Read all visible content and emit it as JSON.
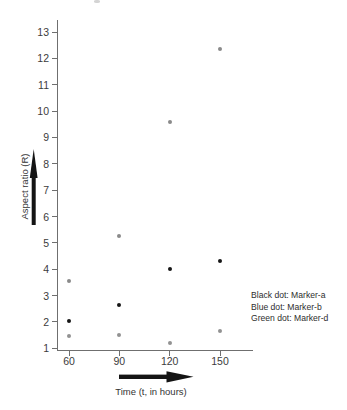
{
  "figure": {
    "background": "#ffffff",
    "axis_color": "#6f6f6f",
    "tick_text_color": "#3c3c3c",
    "arrow_color": "#141414"
  },
  "chart_data": {
    "type": "scatter",
    "title": "",
    "xlabel": "Time (t, in hours)",
    "ylabel": "Aspect ratio (R)",
    "x_ticks": [
      60,
      90,
      120,
      150
    ],
    "y_ticks": [
      1,
      2,
      3,
      4,
      5,
      6,
      7,
      8,
      9,
      10,
      11,
      12,
      13
    ],
    "xlim": [
      55,
      170
    ],
    "ylim": [
      1,
      13.5
    ],
    "grid": false,
    "legend_position": "right-middle",
    "series": [
      {
        "name": "Marker-a",
        "legend_label": "Black dot: Marker-a",
        "color": "#161616",
        "x": [
          60,
          90,
          120,
          150
        ],
        "y": [
          2.05,
          2.65,
          4.0,
          4.3
        ]
      },
      {
        "name": "Marker-b",
        "legend_label": "Blue dot: Marker-b",
        "color": "#8a8a8a",
        "x": [
          60,
          90,
          120,
          150
        ],
        "y": [
          3.55,
          5.25,
          9.6,
          12.35
        ]
      },
      {
        "name": "Marker-d",
        "legend_label": "Green dot: Marker-d",
        "color": "#929292",
        "x": [
          60,
          90,
          120,
          150
        ],
        "y": [
          1.45,
          1.5,
          1.2,
          1.65
        ]
      }
    ]
  }
}
